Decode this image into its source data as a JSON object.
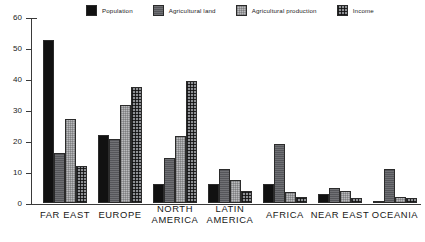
{
  "chart_data": {
    "type": "bar",
    "title": "",
    "subtitle": "",
    "xlabel": "",
    "ylabel": "",
    "ylim": [
      0,
      60
    ],
    "yticks": [
      0,
      10,
      20,
      30,
      40,
      50,
      60
    ],
    "grid": false,
    "legend_position": "top",
    "categories": [
      "FAR EAST",
      "EUROPE",
      "NORTH AMERICA",
      "LATIN AMERICA",
      "AFRICA",
      "NEAR EAST",
      "OCEANIA"
    ],
    "series": [
      {
        "name": "Population",
        "color": "#111111",
        "values": [
          52.5,
          22.0,
          6.0,
          6.0,
          6.0,
          3.0,
          0.5
        ]
      },
      {
        "name": "Agricultural land",
        "color": "#55565a",
        "values": [
          16.0,
          20.5,
          14.5,
          11.0,
          19.0,
          5.0,
          11.0
        ]
      },
      {
        "name": "Agricultural production",
        "color": "#b9babd",
        "values": [
          27.0,
          31.5,
          21.5,
          7.5,
          3.5,
          4.0,
          2.0
        ]
      },
      {
        "name": "Income",
        "color": "#8e9094",
        "values": [
          12.0,
          37.5,
          39.5,
          4.0,
          2.0,
          1.5,
          1.5
        ]
      }
    ]
  },
  "legend": {
    "items": [
      {
        "label": "Population",
        "swatch": "legend-swatch-population"
      },
      {
        "label": "Agricultural land",
        "swatch": "legend-swatch-agricultural-land"
      },
      {
        "label": "Agricultural production",
        "swatch": "legend-swatch-agricultural-production"
      },
      {
        "label": "Income",
        "swatch": "legend-swatch-income"
      }
    ]
  },
  "axis": {
    "y_tick_labels": [
      "60",
      "50",
      "40",
      "30",
      "20",
      "10",
      "0"
    ]
  },
  "categories_display": [
    "FAR EAST",
    "EUROPE",
    "NORTH\nAMERICA",
    "LATIN\nAMERICA",
    "AFRICA",
    "NEAR EAST",
    "OCEANIA"
  ]
}
